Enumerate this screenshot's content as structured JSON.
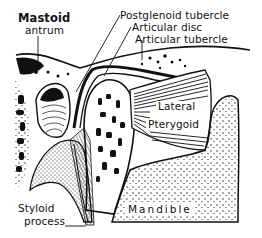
{
  "figure": {
    "colors": {
      "ink": "#111111",
      "background": "#ffffff"
    },
    "labels": {
      "mastoid_line1": "Mastoid",
      "mastoid_line2": "antrum",
      "postglenoid": "Postglenoid tubercle",
      "articular_disc": "Articular disc",
      "articular_tubercle": "Articular tubercle",
      "lateral": "Lateral",
      "pterygoid": "Pterygoid",
      "styloid_line1": "Styloid",
      "styloid_line2": "process",
      "mandible": "Mandible"
    }
  }
}
